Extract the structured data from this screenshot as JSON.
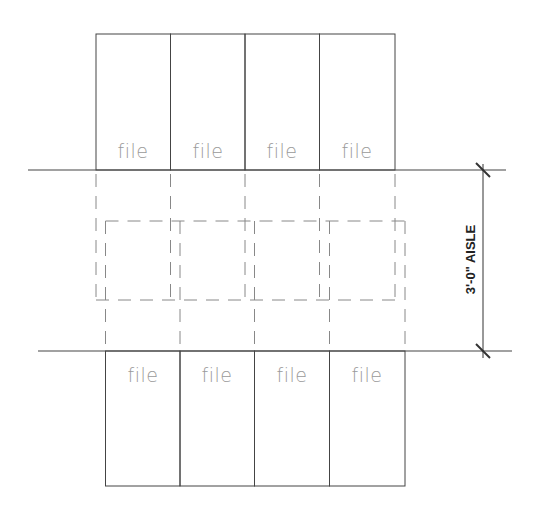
{
  "diagram": {
    "type": "floor-plan",
    "top_row": {
      "labels": [
        "file",
        "file",
        "file",
        "file"
      ]
    },
    "bottom_row": {
      "labels": [
        "file",
        "file",
        "file",
        "file"
      ]
    },
    "dimension": {
      "text": "3'-0\" AISLE"
    },
    "colors": {
      "line": "#333333",
      "dashed": "#888888",
      "label": "#9a9a9a"
    }
  }
}
